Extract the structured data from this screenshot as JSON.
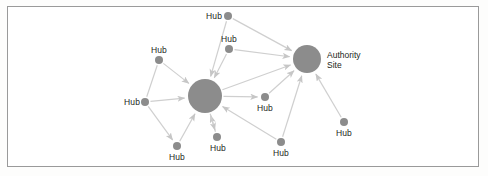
{
  "figure": {
    "background_color": "#ffffff",
    "frame_color": "#9a9a9a",
    "node_fill": "#8c8c8c",
    "edge_color": "#cfcfcf",
    "text_color": "#231f20"
  },
  "chart_data": {
    "type": "diagram",
    "subtype": "directed-node-link-graph",
    "title": "",
    "node_count": 12,
    "edge_count": 17,
    "nodes": [
      {
        "id": "hub1",
        "label": "Hub",
        "role": "hub",
        "x": 228,
        "y": 16,
        "r": 4,
        "label_x": 222,
        "label_y": 11,
        "label_align": "right"
      },
      {
        "id": "hub2",
        "label": "Hub",
        "role": "hub",
        "x": 229,
        "y": 49,
        "r": 4,
        "label_x": 229,
        "label_y": 34,
        "label_align": "center"
      },
      {
        "id": "hub3",
        "label": "Hub",
        "role": "hub",
        "x": 159,
        "y": 60,
        "r": 4,
        "label_x": 159,
        "label_y": 45,
        "label_align": "center"
      },
      {
        "id": "hub4",
        "label": "Hub",
        "role": "hub",
        "x": 145,
        "y": 102,
        "r": 4,
        "label_x": 140,
        "label_y": 97,
        "label_align": "right"
      },
      {
        "id": "hub5",
        "label": "Hub",
        "role": "hub",
        "x": 177,
        "y": 146,
        "r": 4,
        "label_x": 177,
        "label_y": 152,
        "label_align": "center"
      },
      {
        "id": "hub6",
        "label": "Hub",
        "role": "hub",
        "x": 217,
        "y": 137,
        "r": 4,
        "label_x": 218,
        "label_y": 143,
        "label_align": "center"
      },
      {
        "id": "hub7",
        "label": "Hub",
        "role": "hub",
        "x": 265,
        "y": 97,
        "r": 4,
        "label_x": 265,
        "label_y": 103,
        "label_align": "center"
      },
      {
        "id": "hub8",
        "label": "Hub",
        "role": "hub",
        "x": 281,
        "y": 142,
        "r": 4,
        "label_x": 281,
        "label_y": 148,
        "label_align": "center"
      },
      {
        "id": "hub9",
        "label": "Hub",
        "role": "hub",
        "x": 344,
        "y": 122,
        "r": 4,
        "label_x": 344,
        "label_y": 128,
        "label_align": "center"
      },
      {
        "id": "center",
        "label": "",
        "role": "hub-major",
        "x": 205,
        "y": 96,
        "r": 17,
        "label_x": 0,
        "label_y": 0,
        "label_align": "none"
      },
      {
        "id": "authority",
        "label": "Authority Site",
        "role": "authority",
        "x": 307,
        "y": 59,
        "r": 14,
        "label_x": 327,
        "label_y": 50,
        "label_align": "left"
      }
    ],
    "authority_label_lines": [
      "Authority",
      "Site"
    ],
    "edges": [
      {
        "from": "hub1",
        "to": "center",
        "arrow": "to"
      },
      {
        "from": "hub1",
        "to": "authority",
        "arrow": "to"
      },
      {
        "from": "hub2",
        "to": "center",
        "arrow": "to"
      },
      {
        "from": "hub2",
        "to": "authority",
        "arrow": "to"
      },
      {
        "from": "hub3",
        "to": "center",
        "arrow": "to"
      },
      {
        "from": "hub4",
        "to": "center",
        "arrow": "to"
      },
      {
        "from": "hub4",
        "to": "hub5",
        "arrow": "to"
      },
      {
        "from": "hub5",
        "to": "center",
        "arrow": "to"
      },
      {
        "from": "hub6",
        "to": "center",
        "arrow": "to"
      },
      {
        "from": "center",
        "to": "hub7",
        "arrow": "to"
      },
      {
        "from": "hub7",
        "to": "authority",
        "arrow": "to"
      },
      {
        "from": "hub8",
        "to": "center",
        "arrow": "to"
      },
      {
        "from": "hub8",
        "to": "authority",
        "arrow": "to"
      },
      {
        "from": "hub9",
        "to": "authority",
        "arrow": "to"
      },
      {
        "from": "center",
        "to": "authority",
        "arrow": "to"
      },
      {
        "from": "hub3",
        "to": "hub4",
        "arrow": "none"
      },
      {
        "from": "center",
        "to": "hub6",
        "arrow": "to"
      }
    ]
  }
}
